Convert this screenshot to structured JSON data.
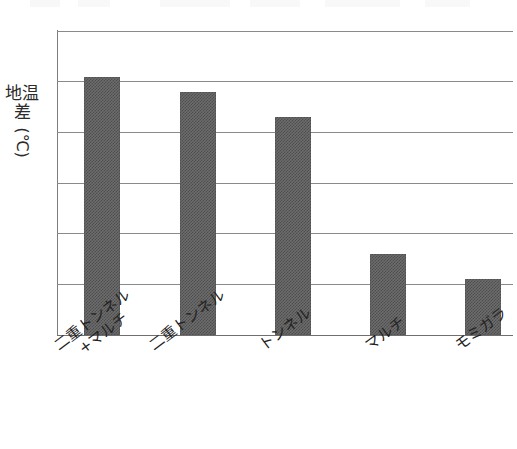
{
  "chart_data": {
    "type": "bar",
    "title": "",
    "xlabel": "",
    "ylabel": "地温差（℃）",
    "ylabel_main": "地温差",
    "ylabel_unit": "(℃)",
    "categories": [
      "二重トンネル+マルチ",
      "二重トンネル",
      "トンネル",
      "マルチ",
      "モミガラ"
    ],
    "category_lines": [
      [
        "二重トンネル",
        "+マルチ"
      ],
      [
        "二重トンネル"
      ],
      [
        "トンネル"
      ],
      [
        "マルチ"
      ],
      [
        "モミガラ"
      ]
    ],
    "values": [
      5.1,
      4.8,
      4.3,
      1.6,
      1.1
    ],
    "ylim": [
      0,
      6
    ],
    "ytick_labels": [
      "6",
      "5",
      "4",
      "3",
      "2",
      "1",
      "0"
    ],
    "ytick_values": [
      6,
      5,
      4,
      3,
      2,
      1,
      0
    ],
    "grid": true,
    "legend": "none",
    "bar_color": "#6d6d6d",
    "bar_pattern": "dither-checker",
    "axis_color": "#7d7d7d",
    "grid_color": "#8a8a8a",
    "text_color": "#232323",
    "background_color": "#ffffff"
  }
}
